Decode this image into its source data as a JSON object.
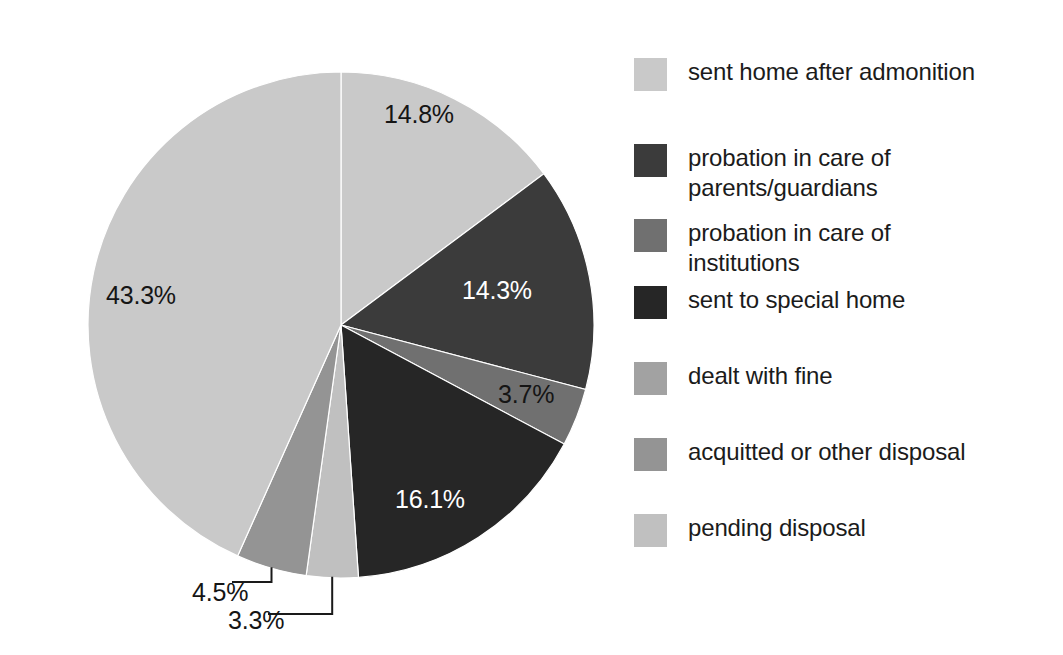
{
  "chart_data": {
    "type": "pie",
    "title": "",
    "subtitle": "",
    "xlabel": "",
    "ylabel": "",
    "legend_position": "right",
    "grid": false,
    "start_angle_deg": 0,
    "direction": "clockwise",
    "categories": [
      "sent home after admonition",
      "probation in care of parents/guardians",
      "probation in care of institutions",
      "sent to special home",
      "dealt with fine",
      "acquitted or other disposal",
      "pending disposal"
    ],
    "values": [
      14.8,
      14.3,
      3.7,
      16.1,
      3.3,
      4.5,
      43.3
    ],
    "value_labels": [
      "14.8%",
      "14.3%",
      "3.7%",
      "16.1%",
      "3.3%",
      "4.5%",
      "43.3%"
    ],
    "colors": [
      "#c9c9c9",
      "#3b3b3b",
      "#707070",
      "#262626",
      "#a2a2a2",
      "#949494",
      "#c0c0c0"
    ],
    "units": "percent"
  },
  "pie": {
    "center_x": 341,
    "center_y": 325,
    "radius": 253,
    "slices": [
      {
        "name": "sent home after admonition",
        "value": 14.8,
        "label": "14.8%",
        "color": "#c9c9c9",
        "start_deg": 0,
        "end_deg": 53.28,
        "label_x": 384,
        "label_y": 100,
        "label_tone": "dark",
        "leader": false
      },
      {
        "name": "probation in care of parents/guardians",
        "value": 14.3,
        "label": "14.3%",
        "color": "#3b3b3b",
        "start_deg": 53.28,
        "end_deg": 104.76,
        "label_x": 462,
        "label_y": 276,
        "label_tone": "light",
        "leader": false
      },
      {
        "name": "probation in care of institutions",
        "value": 3.7,
        "label": "3.7%",
        "color": "#707070",
        "start_deg": 104.76,
        "end_deg": 118.08,
        "label_x": 498,
        "label_y": 380,
        "label_tone": "dark",
        "leader": false
      },
      {
        "name": "sent to special home",
        "value": 16.1,
        "label": "16.1%",
        "color": "#262626",
        "start_deg": 118.08,
        "end_deg": 176.04,
        "label_x": 395,
        "label_y": 485,
        "label_tone": "light",
        "leader": false
      },
      {
        "name": "pending disposal",
        "value": 3.3,
        "label": "3.3%",
        "color": "#c0c0c0",
        "start_deg": 176.04,
        "end_deg": 187.92,
        "label_x": 228,
        "label_y": 606,
        "label_tone": "dark",
        "leader": true
      },
      {
        "name": "acquitted or other disposal",
        "value": 4.5,
        "label": "4.5%",
        "color": "#949494",
        "start_deg": 187.92,
        "end_deg": 204.12,
        "label_x": 192,
        "label_y": 578,
        "label_tone": "dark",
        "leader": true
      },
      {
        "name": "sent home after admonition (largest)",
        "value": 43.3,
        "label": "43.3%",
        "color": "#c9c9c9",
        "start_deg": 204.12,
        "end_deg": 360,
        "label_x": 106,
        "label_y": 281,
        "label_tone": "dark",
        "leader": false
      }
    ]
  },
  "legend": {
    "items": [
      {
        "label": "sent home after admonition",
        "color": "#c9c9c9",
        "top": 0
      },
      {
        "label": "probation in care of\nparents/guardians",
        "color": "#3b3b3b",
        "top": 86
      },
      {
        "label": "probation in care of\ninstitutions",
        "color": "#707070",
        "top": 161
      },
      {
        "label": "sent to special home",
        "color": "#262626",
        "top": 228
      },
      {
        "label": "dealt with fine",
        "color": "#a2a2a2",
        "top": 304
      },
      {
        "label": "acquitted or other disposal",
        "color": "#949494",
        "top": 380
      },
      {
        "label": "pending disposal",
        "color": "#c0c0c0",
        "top": 456
      }
    ]
  }
}
